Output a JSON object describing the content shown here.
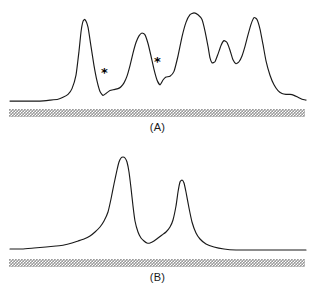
{
  "figure": {
    "background_color": "#ffffff",
    "trace_color": "#1a1a1a",
    "scale_bar_color": "#9a9a9a"
  },
  "panels": [
    {
      "id": "A",
      "label": "(A)",
      "annotations": [
        {
          "symbol": "*",
          "name": "asterisk-marker-1"
        },
        {
          "symbol": "*",
          "name": "asterisk-marker-2"
        }
      ]
    },
    {
      "id": "B",
      "label": "(B)",
      "annotations": []
    }
  ],
  "chart_data": [
    {
      "type": "line",
      "title": "(A)",
      "xlabel": "",
      "ylabel": "",
      "grid": false,
      "legend": "none",
      "axis_visible": false,
      "xlim": [
        0,
        315
      ],
      "ylim": [
        0,
        100
      ],
      "annotations": [
        {
          "text": "*",
          "x": 106,
          "y": 27
        },
        {
          "text": "*",
          "x": 159,
          "y": 38
        }
      ],
      "series": [
        {
          "name": "trace-A",
          "x": [
            10,
            20,
            30,
            40,
            50,
            58,
            63,
            68,
            72,
            76,
            79,
            81,
            83,
            85,
            88,
            91,
            94,
            97,
            100,
            103,
            106,
            110,
            114,
            118,
            121,
            124,
            127,
            130,
            133,
            136,
            139,
            142,
            145,
            148,
            151,
            154,
            157,
            160,
            163,
            166,
            170,
            174,
            178,
            182,
            186,
            190,
            194,
            198,
            202,
            205,
            208,
            210,
            212,
            215,
            218,
            221,
            224,
            227,
            230,
            233,
            236,
            239,
            242,
            245,
            248,
            251,
            254,
            257,
            260,
            263,
            266,
            270,
            274,
            278,
            282,
            286,
            290,
            294,
            298,
            302,
            306
          ],
          "y": [
            3,
            3,
            3,
            3,
            4,
            5,
            7,
            10,
            16,
            30,
            55,
            75,
            86,
            88,
            80,
            60,
            40,
            24,
            13,
            9,
            11,
            14,
            15,
            16,
            18,
            22,
            29,
            40,
            53,
            64,
            71,
            74,
            72,
            63,
            50,
            36,
            25,
            20,
            25,
            28,
            29,
            34,
            50,
            70,
            85,
            93,
            95,
            93,
            88,
            76,
            60,
            48,
            43,
            44,
            52,
            61,
            66,
            64,
            56,
            46,
            42,
            44,
            50,
            60,
            72,
            83,
            90,
            88,
            78,
            62,
            45,
            30,
            20,
            14,
            11,
            10,
            10,
            9,
            7,
            5,
            4
          ]
        }
      ],
      "peaks": [
        {
          "x": 84,
          "height": 88,
          "label": "peak-1"
        },
        {
          "x": 142,
          "height": 74,
          "label": "peak-2"
        },
        {
          "x": 194,
          "height": 95,
          "label": "peak-3"
        },
        {
          "x": 224,
          "height": 66,
          "label": "peak-4"
        },
        {
          "x": 254,
          "height": 90,
          "label": "peak-5"
        }
      ]
    },
    {
      "type": "line",
      "title": "(B)",
      "xlabel": "",
      "ylabel": "",
      "grid": false,
      "legend": "none",
      "axis_visible": false,
      "xlim": [
        0,
        315
      ],
      "ylim": [
        0,
        100
      ],
      "annotations": [],
      "series": [
        {
          "name": "trace-B",
          "x": [
            10,
            22,
            34,
            46,
            56,
            64,
            72,
            78,
            84,
            90,
            95,
            100,
            104,
            108,
            111,
            114,
            117,
            119,
            121,
            123,
            125,
            127,
            129,
            131,
            133,
            135,
            138,
            141,
            144,
            147,
            150,
            154,
            158,
            162,
            166,
            170,
            173,
            176,
            178,
            180,
            182,
            184,
            186,
            189,
            192,
            196,
            200,
            206,
            214,
            224,
            236,
            250,
            264,
            278,
            292,
            306
          ],
          "y": [
            5,
            5,
            6,
            7,
            8,
            9,
            11,
            13,
            15,
            18,
            22,
            27,
            33,
            42,
            55,
            70,
            84,
            92,
            96,
            97,
            96,
            92,
            82,
            66,
            48,
            33,
            22,
            16,
            13,
            11,
            11,
            13,
            16,
            19,
            22,
            27,
            34,
            48,
            62,
            72,
            74,
            71,
            62,
            46,
            32,
            21,
            15,
            10,
            7,
            5,
            4,
            4,
            4,
            4,
            4,
            4
          ]
        }
      ],
      "peaks": [
        {
          "x": 124,
          "height": 97,
          "label": "peak-major"
        },
        {
          "x": 181,
          "height": 74,
          "label": "peak-minor"
        }
      ]
    }
  ]
}
